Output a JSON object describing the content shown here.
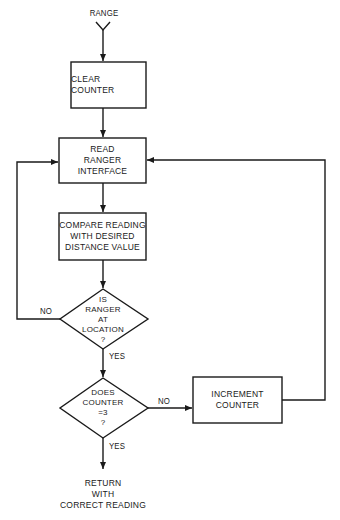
{
  "flowchart": {
    "start": {
      "label": "RANGE"
    },
    "nodes": [
      {
        "id": "clear",
        "type": "process",
        "lines": [
          "CLEAR COUNTER"
        ]
      },
      {
        "id": "read",
        "type": "process",
        "lines": [
          "READ",
          "RANGER",
          "INTERFACE"
        ]
      },
      {
        "id": "compare",
        "type": "process",
        "lines": [
          "COMPARE READING",
          "WITH DESIRED",
          "DISTANCE VALUE"
        ]
      },
      {
        "id": "at_location",
        "type": "decision",
        "lines": [
          "IS",
          "RANGER",
          "AT",
          "LOCATION",
          "?"
        ]
      },
      {
        "id": "counter_eq",
        "type": "decision",
        "lines": [
          "DOES",
          "COUNTER",
          "=3",
          "?"
        ]
      },
      {
        "id": "increment",
        "type": "process",
        "lines": [
          "INCREMENT",
          "COUNTER"
        ]
      },
      {
        "id": "return",
        "type": "terminal",
        "lines": [
          "RETURN",
          "WITH",
          "CORRECT READING"
        ]
      }
    ],
    "edge_labels": {
      "at_location_no": "NO",
      "at_location_yes": "YES",
      "counter_no": "NO",
      "counter_yes": "YES"
    },
    "colors": {
      "stroke": "#1a1a1a",
      "background": "#ffffff"
    }
  }
}
